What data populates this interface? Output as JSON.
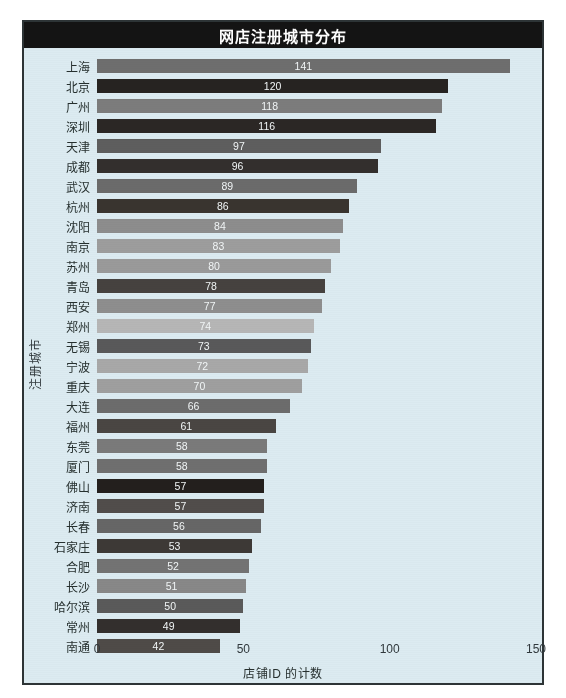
{
  "chart_data": {
    "type": "bar",
    "orientation": "horizontal",
    "title": "网店注册城市分布",
    "xlabel": "店铺ID 的计数",
    "ylabel": "注册城市",
    "xlim": [
      0,
      150
    ],
    "xticks": [
      0,
      50,
      100,
      150
    ],
    "xtick_labels": [
      "0",
      "50",
      "100",
      "150"
    ],
    "grid": false,
    "legend": null,
    "background_color": "#dcebf1",
    "title_bar_color": "#141414",
    "title_text_color": "#ffffff",
    "value_label_color": "#f2f6f7",
    "categories": [
      "上海",
      "北京",
      "广州",
      "深圳",
      "天津",
      "成都",
      "武汉",
      "杭州",
      "沈阳",
      "南京",
      "苏州",
      "青岛",
      "西安",
      "郑州",
      "无锡",
      "宁波",
      "重庆",
      "大连",
      "福州",
      "东莞",
      "厦门",
      "佛山",
      "济南",
      "长春",
      "石家庄",
      "合肥",
      "长沙",
      "哈尔滨",
      "常州",
      "南通"
    ],
    "values": [
      141,
      120,
      118,
      116,
      97,
      96,
      89,
      86,
      84,
      83,
      80,
      78,
      77,
      74,
      73,
      72,
      70,
      66,
      61,
      58,
      58,
      57,
      57,
      56,
      53,
      52,
      51,
      50,
      49,
      42
    ],
    "bar_colors": [
      "#6e6e6e",
      "#262321",
      "#7c7c7c",
      "#2b2725",
      "#5e5e5e",
      "#332f2d",
      "#6b6b6b",
      "#39342f",
      "#8d8d8d",
      "#9d9d9d",
      "#9a9a9a",
      "#46423f",
      "#8e8e8e",
      "#b6b6b6",
      "#59595a",
      "#a8a8a8",
      "#9f9f9f",
      "#6c6c6c",
      "#4a4643",
      "#7a7a7a",
      "#6f6f6f",
      "#231f1d",
      "#514d4b",
      "#666666",
      "#3d3936",
      "#737373",
      "#888888",
      "#5a5a5a",
      "#332f2d",
      "#4f4b48"
    ]
  }
}
